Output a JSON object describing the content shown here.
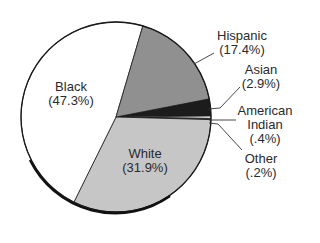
{
  "chart_data": {
    "type": "pie",
    "title": "",
    "start_angle_deg": -11,
    "direction": "clockwise",
    "slices": [
      {
        "key": "asian",
        "label": "Asian",
        "value": 2.9,
        "value_label": "(2.9%)",
        "color": "#1c1c1c"
      },
      {
        "key": "american_indian",
        "label": "American Indian",
        "value": 0.4,
        "value_label": "(.4%)",
        "color": "#ffffff"
      },
      {
        "key": "other",
        "label": "Other",
        "value": 0.2,
        "value_label": "(.2%)",
        "color": "#6a6a6a"
      },
      {
        "key": "white",
        "label": "White",
        "value": 31.9,
        "value_label": "(31.9%)",
        "color": "#c6c6c6"
      },
      {
        "key": "black",
        "label": "Black",
        "value": 47.3,
        "value_label": "(47.3%)",
        "color": "#ffffff"
      },
      {
        "key": "hispanic",
        "label": "Hispanic",
        "value": 17.4,
        "value_label": "(17.4%)",
        "color": "#909090"
      }
    ],
    "center": [
      116,
      117
    ],
    "radius": 95
  },
  "labels": {
    "black": {
      "line1": "Black",
      "line2": "(47.3%)"
    },
    "white": {
      "line1": "White",
      "line2": "(31.9%)"
    },
    "hispanic": {
      "line1": "Hispanic",
      "line2": "(17.4%)"
    },
    "asian": {
      "line1": "Asian",
      "line2": "(2.9%)"
    },
    "american_indian": {
      "line1": "American",
      "line2": "Indian",
      "line3": "(.4%)"
    },
    "other": {
      "line1": "Other",
      "line2": "(.2%)"
    }
  }
}
